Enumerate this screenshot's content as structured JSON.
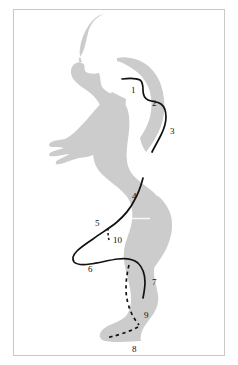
{
  "figure": {
    "name": "running-gait-muscle-chain-diagram",
    "background_color": "#ffffff",
    "border_color": "#c9c9c9",
    "silhouette_color": "#cccccc",
    "line_color": "#121212",
    "label_color": "#121212"
  },
  "callouts": [
    {
      "id": "1",
      "label": "1",
      "x": 131,
      "y": 86,
      "line_style": "solid"
    },
    {
      "id": "2",
      "label": "2",
      "x": 152,
      "y": 99,
      "line_style": "solid"
    },
    {
      "id": "3",
      "label": "3",
      "x": 170,
      "y": 127,
      "line_style": "solid"
    },
    {
      "id": "4",
      "label": "4",
      "x": 132,
      "y": 192,
      "line_style": "solid"
    },
    {
      "id": "5",
      "label": "5",
      "x": 95,
      "y": 219,
      "line_style": "solid"
    },
    {
      "id": "6",
      "label": "6",
      "x": 88,
      "y": 265,
      "line_style": "solid"
    },
    {
      "id": "7",
      "label": "7",
      "x": 152,
      "y": 278,
      "line_style": "solid"
    },
    {
      "id": "8",
      "label": "8",
      "x": 132,
      "y": 345,
      "line_style": "dashed"
    },
    {
      "id": "9",
      "label": "9",
      "x": 144,
      "y": 311,
      "line_style": "dashed"
    },
    {
      "id": "10",
      "label": "10",
      "x": 113,
      "y": 236,
      "line_style": "dashed"
    }
  ]
}
